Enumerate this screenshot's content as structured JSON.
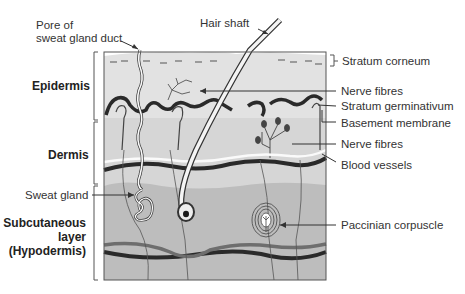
{
  "diagram": {
    "layers": [
      {
        "id": "epidermis",
        "label": "Epidermis"
      },
      {
        "id": "dermis",
        "label": "Dermis"
      },
      {
        "id": "hypodermis",
        "label_line1": "Subcutaneous",
        "label_line2": "layer",
        "label_line3": "(Hypodermis)"
      }
    ],
    "labels": {
      "pore_line1": "Pore of",
      "pore_line2": "sweat gland duct",
      "hair_shaft": "Hair shaft",
      "stratum_corneum": "Stratum corneum",
      "nerve_fibres_top": "Nerve fibres",
      "stratum_germinativum": "Stratum germinativum",
      "basement_membrane": "Basement membrane",
      "nerve_fibres_mid": "Nerve fibres",
      "blood_vessels": "Blood vessels",
      "sweat_gland": "Sweat gland",
      "paccinian_corpuscle": "Paccinian corpuscle"
    },
    "colors": {
      "epidermis_fill": "#dcdcdc",
      "dermis_fill": "#d4d4d4",
      "hypodermis_fill": "#bdbdbd",
      "vessel_dark": "#2a2a2a",
      "vessel_mid": "#6e6e6e",
      "outline": "#333333"
    }
  }
}
